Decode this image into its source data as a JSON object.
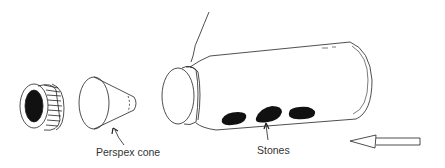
{
  "diagram": {
    "parts": [
      "screw-cap",
      "perspex-cone",
      "bottle",
      "stones",
      "string",
      "flow-arrow"
    ],
    "labels": {
      "cone": "Perspex cone",
      "stones": "Stones"
    },
    "colors": {
      "line": "#222222",
      "fill_dark": "#111111",
      "background": "#ffffff"
    }
  }
}
